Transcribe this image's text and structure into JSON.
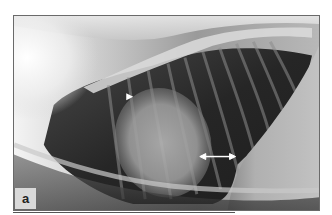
{
  "figure": {
    "panel_label": "a",
    "image_type": "lateral thoracic radiograph",
    "annotations": [
      {
        "type": "arrowhead",
        "direction": "right",
        "x": 128,
        "y": 96,
        "color": "#ffffff"
      },
      {
        "type": "double-arrow",
        "x1": 200,
        "x2": 236,
        "y": 157,
        "color": "#ffffff"
      }
    ],
    "colors": {
      "border": "#6a6a6a",
      "label_bg": "#d9d9d9",
      "label_text": "#222222",
      "lung_dark": "#2a2a2a",
      "bone_bright": "#f2f2f2"
    }
  }
}
